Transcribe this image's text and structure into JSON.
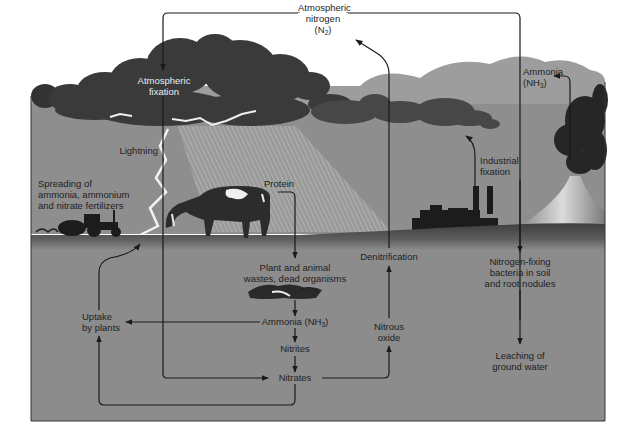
{
  "diagram": {
    "colors": {
      "sky": "#ffffff",
      "background_hills": "#9d9d9d",
      "air": "#8e8e8e",
      "soil": "#8c8c8c",
      "ground_band": "#5a5a5a",
      "storm_cloud": "#3a3a3a",
      "small_cloud": "#474747",
      "lightning": "#f2f2f2",
      "rain": "#b4b4b4",
      "arrow": "#1a1a1a",
      "silhouette": "#1c1c1c",
      "frame": "#333333"
    },
    "labels": {
      "atmospheric_nitrogen": {
        "line1": "Atmospheric",
        "line2": "nitrogen",
        "formula": "N",
        "subscript": "2"
      },
      "atmospheric_fixation": {
        "line1": "Atmospheric",
        "line2": "fixation"
      },
      "lightning": "Lightning",
      "fertilizers": {
        "line1": "Spreading of",
        "line2": "ammonia, ammonium",
        "line3": "and nitrate fertilizers"
      },
      "protein": "Protein",
      "industrial_fixation": {
        "line1": "Industrial",
        "line2": "fixation"
      },
      "ammonia_volcano": {
        "line1": "Ammonia",
        "formula": "NH",
        "subscript": "3"
      },
      "denitrification": "Denitrification",
      "wastes": {
        "line1": "Plant and animal",
        "line2": "wastes, dead organisms"
      },
      "ammonia_soil": {
        "text": "Ammonia (NH",
        "subscript": "3",
        "close": ")"
      },
      "nitrites": "Nitrites",
      "nitrates": "Nitrates",
      "nitrous_oxide": {
        "line1": "Nitrous",
        "line2": "oxide"
      },
      "uptake": {
        "line1": "Uptake",
        "line2": "by plants"
      },
      "nitrogen_fixing_bacteria": {
        "line1": "Nitrogen-fixing",
        "line2": "bacteria in soil",
        "line3": "and root nodules"
      },
      "leaching": {
        "line1": "Leaching of",
        "line2": "ground water"
      }
    },
    "illustrations": [
      "storm-cloud",
      "lightning-bolt",
      "rain",
      "cow",
      "tractor",
      "factory",
      "volcano",
      "decomposing-organisms",
      "small-clouds"
    ]
  }
}
